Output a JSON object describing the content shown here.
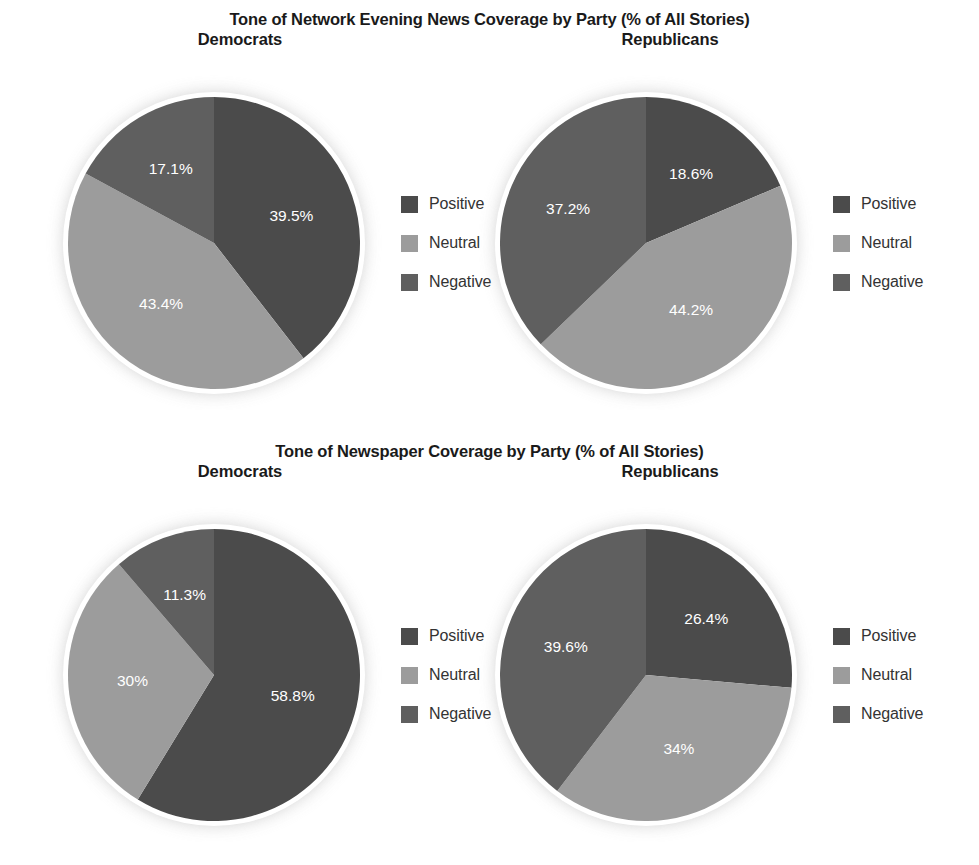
{
  "colors": {
    "positive": "#4b4b4b",
    "neutral": "#9c9c9c",
    "negative": "#5f5f5f",
    "background": "#ffffff",
    "title_text": "#1a1a1a",
    "legend_text": "#333333",
    "slice_label_text": "#ffffff",
    "pie_ring": "#ffffff"
  },
  "legend": {
    "items": [
      {
        "label": "Positive",
        "color_key": "positive"
      },
      {
        "label": "Neutral",
        "color_key": "neutral"
      },
      {
        "label": "Negative",
        "color_key": "negative"
      }
    ]
  },
  "sections": [
    {
      "title": "Tone of Network Evening News Coverage by Party (% of All Stories)",
      "panels": [
        {
          "subtitle": "Democrats",
          "labels": [
            "39.5%",
            "43.4%",
            "17.1%"
          ]
        },
        {
          "subtitle": "Republicans",
          "labels": [
            "18.6%",
            "44.2%",
            "37.2%"
          ]
        }
      ]
    },
    {
      "title": "Tone of Newspaper Coverage by Party (% of All Stories)",
      "panels": [
        {
          "subtitle": "Democrats",
          "labels": [
            "58.8%",
            "30%",
            "11.3%"
          ]
        },
        {
          "subtitle": "Republicans",
          "labels": [
            "26.4%",
            "34%",
            "39.6%"
          ]
        }
      ]
    }
  ],
  "chart_data": [
    {
      "type": "pie",
      "title": "Tone of Network Evening News Coverage by Party (% of All Stories)",
      "subtitle": "Democrats",
      "categories": [
        "Positive",
        "Neutral",
        "Negative"
      ],
      "values": [
        39.5,
        43.4,
        17.1
      ],
      "value_labels": [
        "39.5%",
        "43.4%",
        "17.1%"
      ],
      "unit": "% of All Stories",
      "start_angle_deg": 0,
      "direction": "clockwise",
      "legend_position": "right",
      "grid": false
    },
    {
      "type": "pie",
      "title": "Tone of Network Evening News Coverage by Party (% of All Stories)",
      "subtitle": "Republicans",
      "categories": [
        "Positive",
        "Neutral",
        "Negative"
      ],
      "values": [
        18.6,
        44.2,
        37.2
      ],
      "value_labels": [
        "18.6%",
        "44.2%",
        "37.2%"
      ],
      "unit": "% of All Stories",
      "start_angle_deg": 0,
      "direction": "clockwise",
      "legend_position": "right",
      "grid": false
    },
    {
      "type": "pie",
      "title": "Tone of Newspaper Coverage by Party (% of All Stories)",
      "subtitle": "Democrats",
      "categories": [
        "Positive",
        "Neutral",
        "Negative"
      ],
      "values": [
        58.8,
        30,
        11.3
      ],
      "value_labels": [
        "58.8%",
        "30%",
        "11.3%"
      ],
      "unit": "% of All Stories",
      "start_angle_deg": 0,
      "direction": "clockwise",
      "legend_position": "right",
      "grid": false
    },
    {
      "type": "pie",
      "title": "Tone of Newspaper Coverage by Party (% of All Stories)",
      "subtitle": "Republicans",
      "categories": [
        "Positive",
        "Neutral",
        "Negative"
      ],
      "values": [
        26.4,
        34,
        39.6
      ],
      "value_labels": [
        "26.4%",
        "34%",
        "39.6%"
      ],
      "unit": "% of All Stories",
      "start_angle_deg": 0,
      "direction": "clockwise",
      "legend_position": "right",
      "grid": false
    }
  ]
}
